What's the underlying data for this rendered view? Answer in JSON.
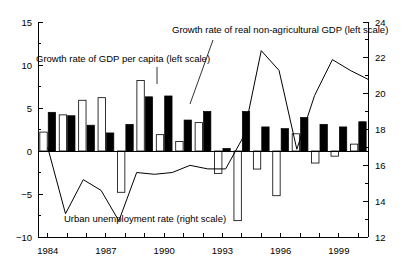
{
  "chart_data": {
    "type": "bar",
    "title": "",
    "subtitle": "",
    "xlabel": "",
    "ylabel": "",
    "y2label": "",
    "grid": false,
    "legend_position": "inline-annotations",
    "x": [
      1984,
      1985,
      1986,
      1987,
      1988,
      1989,
      1990,
      1991,
      1992,
      1993,
      1994,
      1995,
      1996,
      1997,
      1998,
      1999,
      2000
    ],
    "categories": [
      "1984",
      "1985",
      "1986",
      "1987",
      "1988",
      "1989",
      "1990",
      "1991",
      "1992",
      "1993",
      "1994",
      "1995",
      "1996",
      "1997",
      "1998",
      "1999",
      "2000"
    ],
    "xtick_labels_shown": [
      "1984",
      "1987",
      "1990",
      "1993",
      "1996",
      "1999"
    ],
    "xtick_label_years": [
      1984,
      1987,
      1990,
      1993,
      1996,
      1999
    ],
    "xlim": [
      1983.5,
      2000.5
    ],
    "ylim": [
      -10,
      15
    ],
    "yticks": [
      -10,
      -5,
      0,
      5,
      10,
      15
    ],
    "ytick_labels": [
      "−10",
      "−5",
      "0",
      "5",
      "10",
      "15"
    ],
    "y2lim": [
      12,
      24
    ],
    "y2ticks": [
      12,
      14,
      16,
      18,
      20,
      22,
      24
    ],
    "y2tick_labels": [
      "12",
      "14",
      "16",
      "18",
      "20",
      "22",
      "24"
    ],
    "series": [
      {
        "name": "Growth rate of GDP per capita (left scale)",
        "render": "bar",
        "style": "hollow",
        "axis": "left",
        "values": [
          2.2,
          4.2,
          5.9,
          6.2,
          -4.8,
          8.2,
          1.9,
          1.1,
          3.3,
          -2.6,
          20.6,
          21.9,
          19.5,
          2.0,
          -1.4,
          -0.6,
          16.4
        ]
      },
      {
        "name": "Growth rate of real non-agricultural GDP (left scale)",
        "render": "bar",
        "style": "filled",
        "axis": "left",
        "values": [
          4.5,
          4.1,
          3.0,
          2.1,
          3.1,
          6.3,
          6.4,
          3.6,
          4.6,
          0.3,
          4.6,
          2.8,
          2.6,
          3.9,
          3.1,
          2.8,
          3.4
        ]
      },
      {
        "name": "Urban unemployment rate (right scale)",
        "render": "line",
        "style": "solid",
        "axis": "right",
        "values": [
          17.0,
          13.3,
          15.2,
          14.6,
          12.9,
          15.6,
          15.5,
          15.6,
          20.6,
          22.1,
          16.0,
          14.9,
          18.0,
          20.0,
          21.9,
          21.3,
          20.8
        ]
      }
    ],
    "bar_values_hollow": [
      2.2,
      4.2,
      5.9,
      6.2,
      -4.8,
      8.2,
      1.9,
      1.1,
      3.3,
      -2.6,
      -8.1,
      -2.1,
      -5.2,
      2.0,
      -1.4,
      -0.6,
      0.8
    ],
    "bar_values_filled": [
      4.5,
      4.1,
      3.0,
      2.1,
      3.1,
      6.3,
      6.4,
      3.6,
      4.6,
      0.3,
      4.6,
      2.8,
      2.6,
      3.9,
      3.1,
      2.8,
      3.4
    ],
    "line_values_right_axis": [
      17.0,
      13.3,
      15.2,
      14.6,
      12.9,
      15.6,
      15.5,
      15.6,
      16.0,
      15.8,
      15.8,
      17.6,
      22.4,
      21.3,
      16.9,
      19.9,
      21.9,
      21.3,
      20.8
    ],
    "annotations": [
      {
        "id": "ann-gdp-per-capita",
        "text": "Growth rate of GDP per capita (left scale)",
        "text_x": 36,
        "text_y": 62,
        "anchor": "start",
        "leader": [
          [
            157,
            67
          ],
          [
            157,
            84
          ]
        ]
      },
      {
        "id": "ann-nonagri-gdp",
        "text": "Growth rate of real non-agricultural GDP (left scale)",
        "text_x": 172,
        "text_y": 33,
        "anchor": "start",
        "leader": [
          [
            213,
            40
          ],
          [
            190,
            104
          ]
        ]
      },
      {
        "id": "ann-urban-unemployment",
        "text": "Urban unemployment rate (right scale)",
        "text_x": 64,
        "text_y": 222,
        "anchor": "start",
        "leader": null
      }
    ]
  }
}
